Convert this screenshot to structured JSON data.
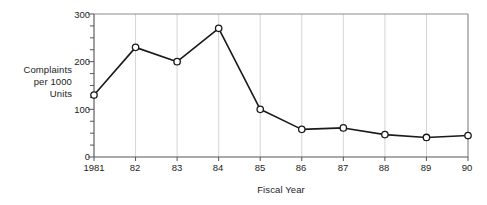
{
  "chart_data": {
    "type": "line",
    "title": "",
    "subtitle": "",
    "xlabel": "Fiscal Year",
    "ylabel": "Complaints per 1000 Units",
    "ylabel_lines": [
      "Complaints",
      "per 1000",
      "Units"
    ],
    "categories": [
      "1981",
      "82",
      "83",
      "84",
      "85",
      "86",
      "87",
      "88",
      "89",
      "90"
    ],
    "values": [
      130,
      230,
      200,
      270,
      100,
      58,
      61,
      47,
      41,
      45
    ],
    "series": [
      {
        "name": "Complaints per 1000 Units",
        "values": [
          130,
          230,
          200,
          270,
          100,
          58,
          61,
          47,
          41,
          45
        ]
      }
    ],
    "ylim": [
      0,
      300
    ],
    "ytick_labels": [
      "0",
      "100",
      "200",
      "300"
    ],
    "ytick_values": [
      0,
      100,
      200,
      300
    ],
    "yminor_interval": 25,
    "xtick_labels": [
      "1981",
      "82",
      "83",
      "84",
      "85",
      "86",
      "87",
      "88",
      "89",
      "90"
    ],
    "grid": "vertical",
    "legend": "none",
    "marker": "open-circle",
    "line_color": "#1a1a1a",
    "marker_fill": "#ffffff",
    "grid_color": "#c9c9c9",
    "axis_color": "#8a8a8a",
    "background": "#ffffff"
  }
}
